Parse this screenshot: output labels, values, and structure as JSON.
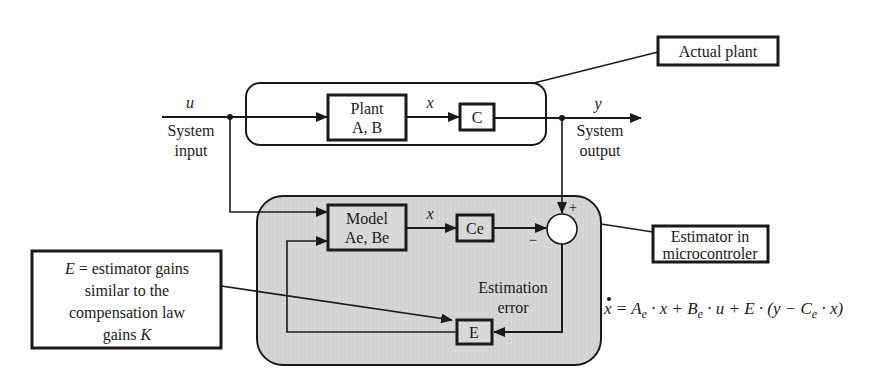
{
  "diagram": {
    "signals": {
      "input_symbol": "u",
      "input_label_line1": "System",
      "input_label_line2": "input",
      "state_symbol": "x",
      "state_symbol_est": "x",
      "output_symbol": "y",
      "output_label_line1": "System",
      "output_label_line2": "output"
    },
    "blocks": {
      "plant_line1": "Plant",
      "plant_line2": "A, B",
      "c": "C",
      "model_line1": "Model",
      "model_line2": "Ae, Be",
      "ce": "Ce",
      "e": "E"
    },
    "summing_junction": {
      "plus": "+",
      "minus": "−"
    },
    "labels": {
      "estimation_error_line1": "Estimation",
      "estimation_error_line2": "error"
    },
    "callouts": {
      "actual_plant": "Actual plant",
      "estimator_line1": "Estimator  in",
      "estimator_line2": "microcontroler",
      "gains_line1_prefix": "E",
      "gains_line1_rest": " = estimator gains",
      "gains_line2": "similar to the",
      "gains_line3": "compensation law",
      "gains_line4_prefix": "gains ",
      "gains_line4_symbol": "K"
    },
    "equation": {
      "lhs": "x",
      "p1": " = A",
      "s1": "e",
      "p2": " · x + B",
      "s2": "e",
      "p3": " · u + E · (y − C",
      "s3": "e",
      "p4": " · x)"
    },
    "colors": {
      "estimator_fill": "#d6d6d6",
      "line": "#1a1a1a",
      "background": "#ffffff"
    }
  }
}
